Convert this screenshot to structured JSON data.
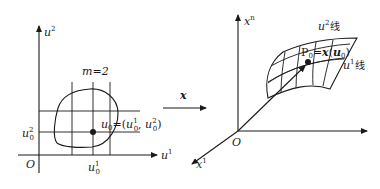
{
  "left_panel": {
    "vertical_axis_label": "u",
    "vertical_axis_sup": "2",
    "horizontal_axis_label": "u",
    "horizontal_axis_sup": "1",
    "origin_label": "O",
    "dimension_label": "m=2",
    "point_label_main": "u",
    "point_label_sub": "0",
    "point_label_eq": "=(",
    "point_coord1_main": "u",
    "point_coord1_sup": "1",
    "point_coord1_sub": "0",
    "point_sep": ", ",
    "point_coord2_main": "u",
    "point_coord2_sup": "2",
    "point_coord2_sub": "0",
    "point_close": ")",
    "tick_u1_main": "u",
    "tick_u1_sup": "1",
    "tick_u1_sub": "0",
    "tick_u2_main": "u",
    "tick_u2_sup": "2",
    "tick_u2_sub": "0"
  },
  "mapping": {
    "label": "x"
  },
  "right_panel": {
    "vertical_axis_label": "x",
    "vertical_axis_sup": "n",
    "diagonal_axis_label": "x",
    "diagonal_axis_sup": "1",
    "origin_label": "O",
    "point_label": "P",
    "point_sub": "0",
    "point_eq": "=",
    "point_func": "x",
    "point_arg_open": "(",
    "point_arg": "u",
    "point_arg_sub": "0",
    "point_arg_close": ")",
    "u2_line_label_main": "u",
    "u2_line_label_sup": "2",
    "u2_line_label_suffix": "线",
    "u1_line_label_main": "u",
    "u1_line_label_sup": "1",
    "u1_line_label_suffix": "线"
  }
}
